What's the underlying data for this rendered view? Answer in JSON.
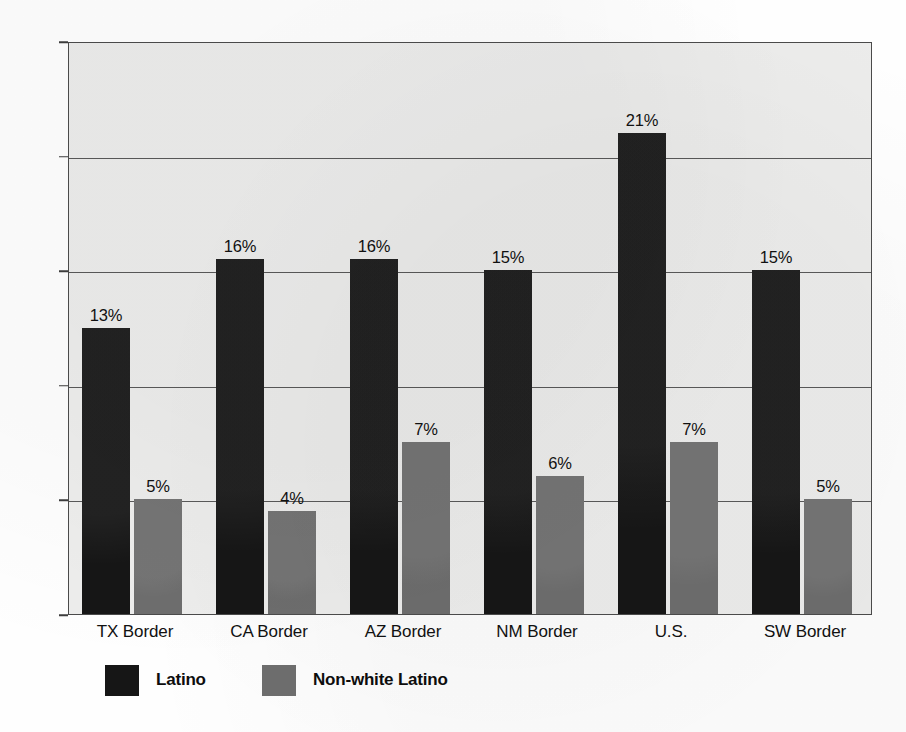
{
  "chart_data": {
    "type": "bar",
    "title": "",
    "xlabel": "",
    "ylabel": "",
    "ylim": [
      0,
      25
    ],
    "grid": true,
    "legend_position": "bottom-left",
    "categories": [
      "TX Border",
      "CA Border",
      "AZ Border",
      "NM Border",
      "U.S.",
      "SW Border"
    ],
    "ytick_labels": [
      "0%",
      "5%",
      "10%",
      "15%",
      "20%",
      "25%"
    ],
    "ytick_values": [
      0,
      5,
      10,
      15,
      20,
      25
    ],
    "series": [
      {
        "name": "Latino",
        "color": "#161616",
        "values": [
          12.5,
          15.5,
          15.5,
          15,
          21,
          15
        ],
        "labels": [
          "13%",
          "16%",
          "16%",
          "15%",
          "21%",
          "15%"
        ]
      },
      {
        "name": "Non-white Latino",
        "color": "#6d6d6d",
        "values": [
          5,
          4.5,
          7.5,
          6,
          7.5,
          5
        ],
        "labels": [
          "5%",
          "4%",
          "7%",
          "6%",
          "7%",
          "5%"
        ]
      }
    ]
  },
  "legend": {
    "items": [
      {
        "label": "Latino",
        "swatch": "black-square-icon"
      },
      {
        "label": "Non-white Latino",
        "swatch": "gray-square-icon"
      }
    ]
  }
}
